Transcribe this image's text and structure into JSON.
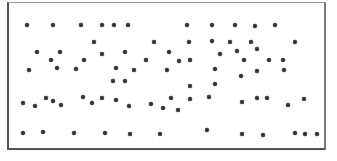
{
  "canvas": {
    "width": 337,
    "height": 161,
    "background": "#ffffff"
  },
  "frame": {
    "x": 7,
    "y": 2,
    "width": 319,
    "height": 148,
    "border_color": "#555555"
  },
  "marker": {
    "shape": "star-icon",
    "color": "#333333",
    "size": 6
  },
  "stars": [
    [
      27,
      25
    ],
    [
      53,
      25
    ],
    [
      81,
      25
    ],
    [
      102,
      25
    ],
    [
      114,
      25
    ],
    [
      128,
      25
    ],
    [
      187,
      25
    ],
    [
      212,
      25
    ],
    [
      235,
      25
    ],
    [
      255,
      26
    ],
    [
      275,
      25
    ],
    [
      94,
      42
    ],
    [
      154,
      42
    ],
    [
      189,
      42
    ],
    [
      212,
      41
    ],
    [
      230,
      42
    ],
    [
      251,
      42
    ],
    [
      295,
      42
    ],
    [
      37,
      52
    ],
    [
      60,
      52
    ],
    [
      102,
      54
    ],
    [
      125,
      52
    ],
    [
      169,
      52
    ],
    [
      220,
      54
    ],
    [
      237,
      51
    ],
    [
      257,
      49
    ],
    [
      51,
      60
    ],
    [
      84,
      60
    ],
    [
      146,
      60
    ],
    [
      179,
      61
    ],
    [
      190,
      60
    ],
    [
      244,
      60
    ],
    [
      269,
      60
    ],
    [
      283,
      60
    ],
    [
      29,
      70
    ],
    [
      57,
      68
    ],
    [
      76,
      69
    ],
    [
      116,
      68
    ],
    [
      134,
      70
    ],
    [
      167,
      70
    ],
    [
      215,
      69
    ],
    [
      257,
      71
    ],
    [
      284,
      70
    ],
    [
      241,
      76
    ],
    [
      113,
      81
    ],
    [
      125,
      81
    ],
    [
      190,
      86
    ],
    [
      215,
      84
    ],
    [
      23,
      103
    ],
    [
      35,
      106
    ],
    [
      46,
      98
    ],
    [
      53,
      101
    ],
    [
      61,
      105
    ],
    [
      83,
      97
    ],
    [
      92,
      103
    ],
    [
      102,
      98
    ],
    [
      116,
      100
    ],
    [
      129,
      106
    ],
    [
      151,
      104
    ],
    [
      163,
      108
    ],
    [
      171,
      98
    ],
    [
      178,
      110
    ],
    [
      190,
      99
    ],
    [
      209,
      97
    ],
    [
      242,
      102
    ],
    [
      257,
      98
    ],
    [
      267,
      98
    ],
    [
      288,
      105
    ],
    [
      304,
      99
    ],
    [
      23,
      133
    ],
    [
      43,
      132
    ],
    [
      74,
      133
    ],
    [
      105,
      133
    ],
    [
      130,
      134
    ],
    [
      160,
      134
    ],
    [
      207,
      130
    ],
    [
      242,
      134
    ],
    [
      263,
      135
    ],
    [
      295,
      133
    ],
    [
      305,
      134
    ],
    [
      317,
      134
    ]
  ]
}
